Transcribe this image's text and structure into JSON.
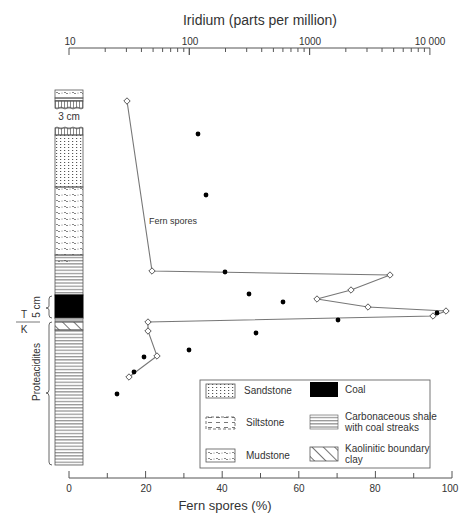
{
  "chart_data": {
    "type": "scatter",
    "title": "",
    "top_axis": {
      "label": "Iridium (parts per million)",
      "scale": "log",
      "tick_labels": [
        "10",
        "100",
        "1000",
        "10 000"
      ],
      "range": [
        10,
        10000
      ]
    },
    "bottom_axis": {
      "label": "Fern spores (%)",
      "scale": "linear",
      "tick_labels": [
        "0",
        "20",
        "40",
        "60",
        "80",
        "100"
      ],
      "range": [
        0,
        100
      ]
    },
    "series": [
      {
        "name": "Fern spores",
        "marker": "open-diamond",
        "connected": true,
        "points_px": [
          [
            127,
            101
          ],
          [
            152,
            271
          ],
          [
            390,
            275
          ],
          [
            351,
            290
          ],
          [
            317,
            299
          ],
          [
            368,
            307
          ],
          [
            446,
            311
          ],
          [
            433,
            316
          ],
          [
            148,
            322
          ],
          [
            148,
            331
          ],
          [
            157,
            356
          ],
          [
            129,
            377
          ]
        ],
        "values_percent": [
          15,
          22,
          84,
          74,
          65,
          78,
          99,
          95,
          21,
          21,
          23,
          16
        ]
      },
      {
        "name": "Iridium",
        "marker": "filled-circle",
        "connected": false,
        "points_px": [
          [
            198,
            134
          ],
          [
            206,
            195
          ],
          [
            225,
            272
          ],
          [
            249,
            294
          ],
          [
            283,
            302
          ],
          [
            437,
            313
          ],
          [
            338,
            320
          ],
          [
            256,
            333
          ],
          [
            189,
            350
          ],
          [
            144,
            357
          ],
          [
            134,
            372
          ],
          [
            117,
            394
          ]
        ],
        "values_ppm": [
          130,
          150,
          200,
          290,
          500,
          6400,
          1100,
          330,
          110,
          50,
          40,
          28
        ]
      }
    ],
    "annotations": [
      "Fern spores",
      "3 cm",
      "5 cm",
      "T",
      "K",
      "Proteacidites"
    ],
    "legend": [
      {
        "label": "Sandstone",
        "pattern": "dots-grid"
      },
      {
        "label": "Coal",
        "pattern": "solid-black"
      },
      {
        "label": "Siltstone",
        "pattern": "dashes"
      },
      {
        "label": "Carbonaceous shale with coal streaks",
        "pattern": "horizontal-lines"
      },
      {
        "label": "Mudstone",
        "pattern": "wavy"
      },
      {
        "label": "Kaolinitic boundary clay",
        "pattern": "diagonal-hatch"
      }
    ]
  },
  "labels": {
    "top_title": "Iridium (parts per million)",
    "top_ticks": [
      "10",
      "100",
      "1000",
      "10 000"
    ],
    "bottom_title": "Fern spores (%)",
    "bottom_ticks": [
      "0",
      "20",
      "40",
      "60",
      "80",
      "100"
    ],
    "fern_annotation": "Fern spores",
    "gap": "3 cm",
    "coal_thickness": "5 cm",
    "t": "T",
    "k": "K",
    "zone": "Proteacidites",
    "legend": {
      "sandstone": "Sandstone",
      "coal": "Coal",
      "siltstone": "Siltstone",
      "shale1": "Carbonaceous shale",
      "shale2": "with coal streaks",
      "mudstone": "Mudstone",
      "clay1": "Kaolinitic boundary",
      "clay2": "clay"
    }
  }
}
